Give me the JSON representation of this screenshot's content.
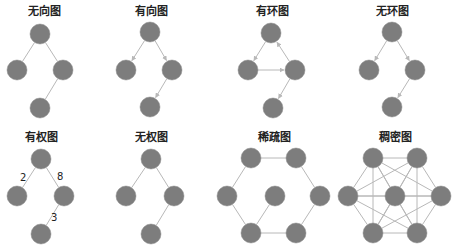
{
  "colors": {
    "node": "#7d7d7d",
    "node_edge": "#8a8a8a",
    "edge": "#b8b8b8",
    "text": "#222222",
    "background": "#ffffff"
  },
  "node_radius": 10,
  "panels": [
    {
      "id": "undirected",
      "title": "无向图",
      "title_pos": [
        44,
        6
      ],
      "directed": false,
      "nodes": [
        [
          40,
          34
        ],
        [
          17,
          70
        ],
        [
          63,
          70
        ],
        [
          40,
          108
        ]
      ],
      "edges": [
        [
          0,
          1
        ],
        [
          0,
          2
        ],
        [
          2,
          3
        ]
      ],
      "weights": []
    },
    {
      "id": "directed",
      "title": "有向图",
      "title_pos": [
        151,
        6
      ],
      "directed": true,
      "nodes": [
        [
          150,
          32
        ],
        [
          126,
          70
        ],
        [
          172,
          70
        ],
        [
          150,
          107
        ]
      ],
      "edges": [
        [
          0,
          1
        ],
        [
          0,
          2
        ],
        [
          2,
          3
        ]
      ],
      "weights": []
    },
    {
      "id": "cyclic",
      "title": "有环图",
      "title_pos": [
        272,
        6
      ],
      "directed": true,
      "nodes": [
        [
          271,
          33
        ],
        [
          248,
          70
        ],
        [
          295,
          70
        ],
        [
          273,
          108
        ]
      ],
      "edges": [
        [
          0,
          1
        ],
        [
          1,
          2
        ],
        [
          2,
          0
        ],
        [
          2,
          3
        ]
      ],
      "weights": []
    },
    {
      "id": "acyclic",
      "title": "无环图",
      "title_pos": [
        392,
        6
      ],
      "directed": true,
      "nodes": [
        [
          392,
          32
        ],
        [
          369,
          70
        ],
        [
          415,
          70
        ],
        [
          392,
          107
        ]
      ],
      "edges": [
        [
          0,
          1
        ],
        [
          0,
          2
        ],
        [
          2,
          3
        ]
      ],
      "weights": []
    },
    {
      "id": "weighted",
      "title": "有权图",
      "title_pos": [
        41,
        132
      ],
      "directed": false,
      "nodes": [
        [
          41,
          159
        ],
        [
          17,
          196
        ],
        [
          64,
          196
        ],
        [
          41,
          234
        ]
      ],
      "edges": [
        [
          0,
          1
        ],
        [
          0,
          2
        ],
        [
          2,
          3
        ]
      ],
      "weights": [
        {
          "label": "2",
          "pos": [
            20,
            173
          ]
        },
        {
          "label": "8",
          "pos": [
            57,
            172
          ]
        },
        {
          "label": "3",
          "pos": [
            51,
            213
          ]
        }
      ]
    },
    {
      "id": "unweighted",
      "title": "无权图",
      "title_pos": [
        151,
        132
      ],
      "directed": false,
      "nodes": [
        [
          151,
          159
        ],
        [
          126,
          196
        ],
        [
          174,
          196
        ],
        [
          151,
          234
        ]
      ],
      "edges": [
        [
          0,
          1
        ],
        [
          0,
          2
        ],
        [
          2,
          3
        ]
      ],
      "weights": []
    },
    {
      "id": "sparse",
      "title": "稀疏图",
      "title_pos": [
        274,
        132
      ],
      "directed": false,
      "nodes": [
        [
          251,
          158
        ],
        [
          296,
          158
        ],
        [
          227,
          196
        ],
        [
          275,
          196
        ],
        [
          320,
          196
        ],
        [
          251,
          233
        ],
        [
          296,
          233
        ]
      ],
      "edges": [
        [
          0,
          1
        ],
        [
          1,
          4
        ],
        [
          4,
          6
        ],
        [
          6,
          5
        ],
        [
          5,
          2
        ],
        [
          2,
          0
        ],
        [
          3,
          5
        ]
      ],
      "weights": []
    },
    {
      "id": "dense",
      "title": "稠密图",
      "title_pos": [
        395,
        132
      ],
      "directed": false,
      "nodes": [
        [
          373,
          158
        ],
        [
          417,
          158
        ],
        [
          348,
          196
        ],
        [
          395,
          196
        ],
        [
          441,
          196
        ],
        [
          373,
          233
        ],
        [
          417,
          233
        ]
      ],
      "edges": [
        [
          0,
          1
        ],
        [
          0,
          2
        ],
        [
          0,
          3
        ],
        [
          0,
          4
        ],
        [
          0,
          5
        ],
        [
          0,
          6
        ],
        [
          1,
          2
        ],
        [
          1,
          3
        ],
        [
          1,
          4
        ],
        [
          1,
          5
        ],
        [
          1,
          6
        ],
        [
          2,
          3
        ],
        [
          2,
          4
        ],
        [
          2,
          5
        ],
        [
          2,
          6
        ],
        [
          3,
          4
        ],
        [
          3,
          5
        ],
        [
          3,
          6
        ],
        [
          4,
          5
        ],
        [
          4,
          6
        ],
        [
          5,
          6
        ]
      ],
      "weights": []
    }
  ]
}
